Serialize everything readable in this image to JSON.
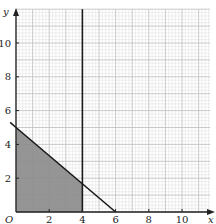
{
  "chart_data": {
    "type": "area",
    "title": "",
    "xlabel": "x",
    "ylabel": "y",
    "origin_label": "O",
    "xlim": [
      0,
      11.7
    ],
    "ylim": [
      0,
      12
    ],
    "x_ticks": [
      2,
      4,
      6,
      8,
      10
    ],
    "y_ticks": [
      2,
      4,
      6,
      8,
      10
    ],
    "grid": {
      "on": true,
      "minor_step": 0.2,
      "major_step": 1
    },
    "lines": [
      {
        "name": "x = 4",
        "type": "vertical",
        "x": 4
      },
      {
        "name": "5x + 6y = 30",
        "type": "segment",
        "points": [
          [
            -0.35,
            5.3
          ],
          [
            0,
            5
          ],
          [
            6,
            0
          ]
        ]
      }
    ],
    "shaded_region": {
      "description": "x >= 0, y >= 0, x <= 4, 5x + 6y <= 30",
      "vertices": [
        [
          0,
          0
        ],
        [
          0,
          5
        ],
        [
          4,
          1.667
        ],
        [
          4,
          0
        ]
      ]
    },
    "colors": {
      "shade": "#8c8c8c",
      "minor_grid": "#dedede",
      "major_grid": "#bdbdbd",
      "axis": "#222222"
    }
  }
}
